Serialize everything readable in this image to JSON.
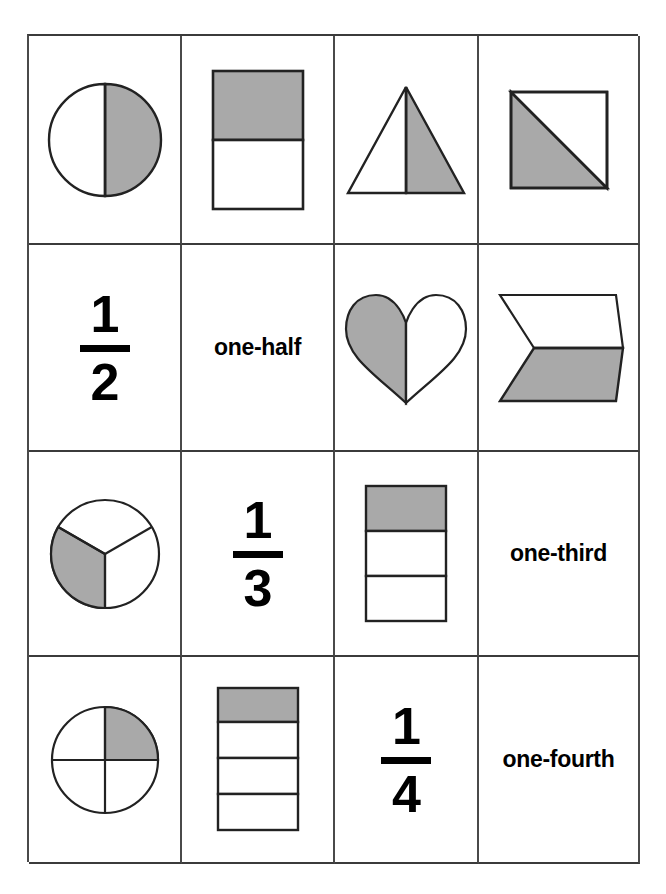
{
  "page": {
    "background_color": "#ffffff",
    "grid_line_color": "#3b3b3b",
    "shade_color": "#a9a9a9",
    "outline_color": "#222222",
    "text_color": "#000000",
    "rows": 4,
    "columns": 4
  },
  "cards": [
    {
      "id": "r1c1",
      "row": 1,
      "column": 1,
      "kind": "shape",
      "shape": "circle-halves",
      "shape_label": "circle divided into 2 halves",
      "total_parts": 2,
      "shaded_parts": 1,
      "shaded_position": "right half",
      "fraction": "1/2",
      "text": ""
    },
    {
      "id": "r1c2",
      "row": 1,
      "column": 2,
      "kind": "shape",
      "shape": "rectangle-halves",
      "shape_label": "rectangle divided into 2 horizontal halves",
      "total_parts": 2,
      "shaded_parts": 1,
      "shaded_position": "top half",
      "fraction": "1/2",
      "text": ""
    },
    {
      "id": "r1c3",
      "row": 1,
      "column": 3,
      "kind": "shape",
      "shape": "triangle-halves",
      "shape_label": "triangle divided into 2 halves",
      "total_parts": 2,
      "shaded_parts": 1,
      "shaded_position": "right half",
      "fraction": "1/2",
      "text": ""
    },
    {
      "id": "r1c4",
      "row": 1,
      "column": 4,
      "kind": "shape",
      "shape": "square-diagonal-halves",
      "shape_label": "square divided by a diagonal into 2 halves",
      "total_parts": 2,
      "shaded_parts": 1,
      "shaded_position": "lower left triangle",
      "fraction": "1/2",
      "text": ""
    },
    {
      "id": "r2c1",
      "row": 2,
      "column": 1,
      "kind": "fraction",
      "shape": "",
      "shape_label": "",
      "numerator": "1",
      "denominator": "2",
      "fraction": "1/2",
      "text": ""
    },
    {
      "id": "r2c2",
      "row": 2,
      "column": 2,
      "kind": "word",
      "shape": "",
      "shape_label": "",
      "fraction": "1/2",
      "text": "one-half"
    },
    {
      "id": "r2c3",
      "row": 2,
      "column": 3,
      "kind": "shape",
      "shape": "heart-halves",
      "shape_label": "heart divided into 2 halves",
      "total_parts": 2,
      "shaded_parts": 1,
      "shaded_position": "left half",
      "fraction": "1/2",
      "text": ""
    },
    {
      "id": "r2c4",
      "row": 2,
      "column": 4,
      "kind": "shape",
      "shape": "parallelogram-halves",
      "shape_label": "parallelogram divided into 2 halves",
      "total_parts": 2,
      "shaded_parts": 1,
      "shaded_position": "bottom half",
      "fraction": "1/2",
      "text": ""
    },
    {
      "id": "r3c1",
      "row": 3,
      "column": 1,
      "kind": "shape",
      "shape": "circle-thirds",
      "shape_label": "circle divided into 3 equal sectors",
      "total_parts": 3,
      "shaded_parts": 1,
      "shaded_position": "lower left sector",
      "fraction": "1/3",
      "text": ""
    },
    {
      "id": "r3c2",
      "row": 3,
      "column": 2,
      "kind": "fraction",
      "shape": "",
      "shape_label": "",
      "numerator": "1",
      "denominator": "3",
      "fraction": "1/3",
      "text": ""
    },
    {
      "id": "r3c3",
      "row": 3,
      "column": 3,
      "kind": "shape",
      "shape": "rectangle-thirds",
      "shape_label": "rectangle divided into 3 horizontal bands",
      "total_parts": 3,
      "shaded_parts": 1,
      "shaded_position": "top band",
      "fraction": "1/3",
      "text": ""
    },
    {
      "id": "r3c4",
      "row": 3,
      "column": 4,
      "kind": "word",
      "shape": "",
      "shape_label": "",
      "fraction": "1/3",
      "text": "one-third"
    },
    {
      "id": "r4c1",
      "row": 4,
      "column": 1,
      "kind": "shape",
      "shape": "circle-quarters",
      "shape_label": "circle divided into 4 quarters",
      "total_parts": 4,
      "shaded_parts": 1,
      "shaded_position": "upper right quarter",
      "fraction": "1/4",
      "text": ""
    },
    {
      "id": "r4c2",
      "row": 4,
      "column": 2,
      "kind": "shape",
      "shape": "rectangle-fourths",
      "shape_label": "rectangle divided into 4 horizontal bands",
      "total_parts": 4,
      "shaded_parts": 1,
      "shaded_position": "top band",
      "fraction": "1/4",
      "text": ""
    },
    {
      "id": "r4c3",
      "row": 4,
      "column": 3,
      "kind": "fraction",
      "shape": "",
      "shape_label": "",
      "numerator": "1",
      "denominator": "4",
      "fraction": "1/4",
      "text": ""
    },
    {
      "id": "r4c4",
      "row": 4,
      "column": 4,
      "kind": "word",
      "shape": "",
      "shape_label": "",
      "fraction": "1/4",
      "text": "one-fourth"
    }
  ]
}
